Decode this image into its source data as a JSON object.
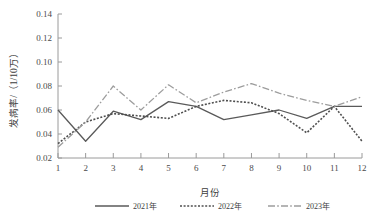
{
  "chart_data": {
    "type": "line",
    "title": "",
    "xlabel": "月份",
    "ylabel": "发病率/（1/10万）",
    "categories": [
      "1",
      "2",
      "3",
      "4",
      "5",
      "6",
      "7",
      "8",
      "9",
      "10",
      "11",
      "12"
    ],
    "x": [
      1,
      2,
      3,
      4,
      5,
      6,
      7,
      8,
      9,
      10,
      11,
      12
    ],
    "xlim": [
      1,
      12
    ],
    "ylim": [
      0.02,
      0.14
    ],
    "yticks": [
      0.02,
      0.04,
      0.06,
      0.08,
      0.1,
      0.12,
      0.14
    ],
    "ytick_labels": [
      "0.02",
      "0.04",
      "0.06",
      "0.08",
      "0.10",
      "0.12",
      "0.14"
    ],
    "grid": false,
    "legend_position": "bottom",
    "series": [
      {
        "name": "2021年",
        "style": "solid",
        "color": "#5a5a5a",
        "values": [
          0.06,
          0.034,
          0.059,
          0.052,
          0.067,
          0.063,
          0.052,
          0.056,
          0.06,
          0.053,
          0.063,
          0.063
        ]
      },
      {
        "name": "2022年",
        "style": "dotted",
        "color": "#4f4f4f",
        "values": [
          0.032,
          0.05,
          0.057,
          0.055,
          0.053,
          0.063,
          0.068,
          0.066,
          0.057,
          0.041,
          0.063,
          0.034
        ]
      },
      {
        "name": "2023年",
        "style": "dashdot",
        "color": "#9d9d9d",
        "values": [
          0.029,
          0.05,
          0.08,
          0.06,
          0.081,
          0.066,
          0.075,
          0.082,
          0.074,
          0.068,
          0.063,
          0.071
        ]
      }
    ]
  },
  "legend": {
    "items": [
      {
        "label": "2021年",
        "style": "solid",
        "color": "#5a5a5a"
      },
      {
        "label": "2022年",
        "style": "dotted",
        "color": "#4f4f4f"
      },
      {
        "label": "2023年",
        "style": "dashdot",
        "color": "#9d9d9d"
      }
    ]
  }
}
